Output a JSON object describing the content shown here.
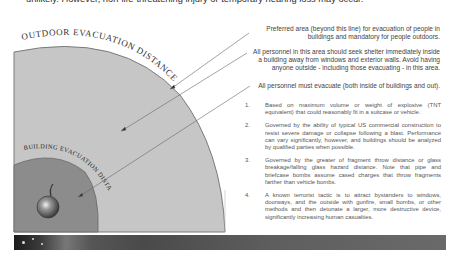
{
  "intro": {
    "line1": "unlikely. However, non-life-threatening injury or temporary hearing loss may occur."
  },
  "diagram": {
    "outer_zone_label": "Outdoor Evacuation Distance",
    "inner_zone_label": "Building Evacuation Distance",
    "bomb_icon": "bomb-icon",
    "colors": {
      "outer_zone": "#c4c4c4",
      "inner_zone": "#8a8a8a",
      "arc_stroke": "#777777",
      "leader_line": "#666666"
    }
  },
  "callouts": [
    {
      "text_line1": "Preferred area (beyond this line) for evacuation of people in",
      "text_line2": "buildings and mandatory for people outdoors."
    },
    {
      "text_line1": "All personnel in this area should seek shelter immediately inside",
      "text_line2": "a building away from windows and exterior walls.  Avoid having",
      "text_line3": "anyone outside - including those evacuating - in this area."
    },
    {
      "text_line1": "All personnel must evacuate (both inside of buildings and out)."
    }
  ],
  "notes": [
    {
      "num": "1.",
      "text": "Based on maximum volume or weight of explosive (TNT equivalent) that could reasonably fit in a suitcase or vehicle."
    },
    {
      "num": "2.",
      "text": "Governed by the ability of typical US commercial construction to resist severe damage or collapse following a blast. Performance can vary significantly, however, and buildings should be analyzed by qualified parties when possible."
    },
    {
      "num": "3.",
      "text": "Governed by the greater of fragment throw distance or glass breakage/falling glass hazard distance.  Note that pipe and briefcase bombs assume cased charges that throw fragments farther than vehicle bombs."
    },
    {
      "num": "4.",
      "text": "A known terrorist tactic is to attract bystanders to windows, doorways, and the outside with gunfire, small bombs, or other methods and then detonate a larger, more destructive device, significantly increasing human casualties."
    }
  ]
}
